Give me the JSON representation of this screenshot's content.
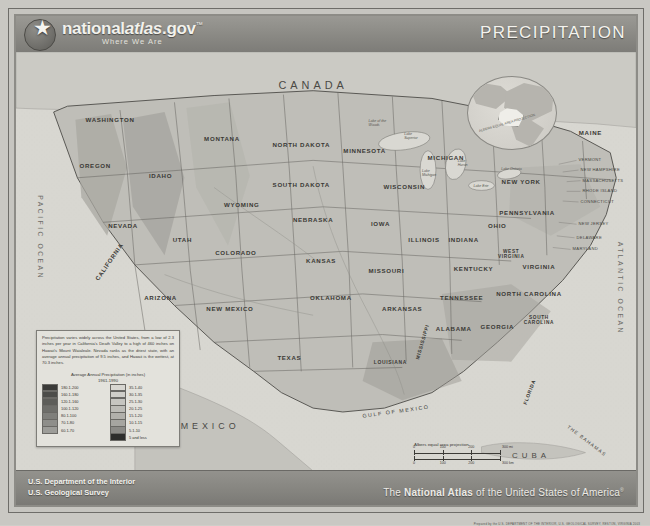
{
  "header": {
    "brand_main": "nationalatlas.gov",
    "brand_main_pre": "national",
    "brand_main_italic": "atlas",
    "brand_main_post": ".gov",
    "trademark": "™",
    "tagline": "Where We Are",
    "seal_icon": "doi-star-seal",
    "title": "PRECIPITATION"
  },
  "map": {
    "countries": [
      "CANADA",
      "MEXICO",
      "CUBA"
    ],
    "oceans": [
      "PACIFIC OCEAN",
      "ATLANTIC OCEAN"
    ],
    "water_bodies": [
      "GULF OF MEXICO",
      "THE BAHAMAS"
    ],
    "states": [
      "WASHINGTON",
      "OREGON",
      "IDAHO",
      "MONTANA",
      "NORTH DAKOTA",
      "MINNESOTA",
      "WISCONSIN",
      "MICHIGAN",
      "NEW YORK",
      "MAINE",
      "NEVADA",
      "UTAH",
      "WYOMING",
      "SOUTH DAKOTA",
      "IOWA",
      "ILLINOIS",
      "INDIANA",
      "OHIO",
      "PENNSYLVANIA",
      "CALIFORNIA",
      "COLORADO",
      "NEBRASKA",
      "KANSAS",
      "MISSOURI",
      "KENTUCKY",
      "WEST VIRGINIA",
      "VIRGINIA",
      "ARIZONA",
      "NEW MEXICO",
      "OKLAHOMA",
      "ARKANSAS",
      "TENNESSEE",
      "NORTH CAROLINA",
      "SOUTH CAROLINA",
      "TEXAS",
      "LOUISIANA",
      "MISSISSIPPI",
      "ALABAMA",
      "GEORGIA",
      "FLORIDA"
    ],
    "small_state_labels": [
      "VERMONT",
      "NEW HAMPSHIRE",
      "MASSACHUSETTS",
      "RHODE ISLAND",
      "CONNECTICUT",
      "NEW JERSEY",
      "DELAWARE",
      "MARYLAND"
    ],
    "lake_labels": [
      "Lake of the Woods",
      "Lake Superior",
      "Lake Michigan",
      "Lake Huron",
      "Lake Erie",
      "Lake Ontario"
    ],
    "inset_caption": "ALBERS EQUAL AREA PROJECTION",
    "inset_name": "alaska-inset"
  },
  "legend": {
    "blurb": "Precipitation varies widely across the United States, from a low of 2.3 inches per year in California's Death Valley to a high of 460 inches on Hawaii's Mount Waialeale. Nevada ranks as the driest state, with an average annual precipitation of 9.5 inches, and Hawaii is the wettest, at 70.3 inches.",
    "title_line1": "Average Annual Precipitation (in inches)",
    "title_line2": "1961-1990",
    "classes_left": [
      {
        "label": "180.1-200",
        "color": "#3a3a38"
      },
      {
        "label": "160.1-180",
        "color": "#4c4c49"
      },
      {
        "label": "120.1-160",
        "color": "#5d5d59"
      },
      {
        "label": "100.1-120",
        "color": "#6e6e6a"
      },
      {
        "label": "80.1-100",
        "color": "#7f7f7b"
      },
      {
        "label": "70.1-80",
        "color": "#8e8e8a"
      },
      {
        "label": "60.1-70",
        "color": "#9c9c98"
      }
    ],
    "classes_right": [
      {
        "label": "35.1-40",
        "color": "#d7d6d1"
      },
      {
        "label": "30.1-35",
        "color": "#cfcec9"
      },
      {
        "label": "25.1-30",
        "color": "#c6c5c0"
      },
      {
        "label": "20.1-25",
        "color": "#bcbbb6"
      },
      {
        "label": "15.1-20",
        "color": "#b1b0ab"
      },
      {
        "label": "10.1-15",
        "color": "#a6a5a0"
      },
      {
        "label": "5.1-10",
        "color": "#8b8a86"
      },
      {
        "label": "5 and less",
        "color": "#2e2e2c"
      }
    ]
  },
  "scale": {
    "projection": "Albers equal area projection",
    "miles_ticks": [
      "0",
      "100",
      "200",
      "300 mi"
    ],
    "km_ticks": [
      "0",
      "100",
      "200",
      "300 km"
    ]
  },
  "footer": {
    "agency_line1": "U.S. Department of the Interior",
    "agency_line2": "U.S. Geological Survey",
    "atlas_pre": "The ",
    "atlas_bold": "National Atlas",
    "atlas_post": " of the United States of America",
    "atlas_reg": "®",
    "credit": "Prepared by the U.S. DEPARTMENT OF THE INTERIOR, U.S. GEOLOGICAL SURVEY, RESTON, VIRGINIA  2003"
  }
}
